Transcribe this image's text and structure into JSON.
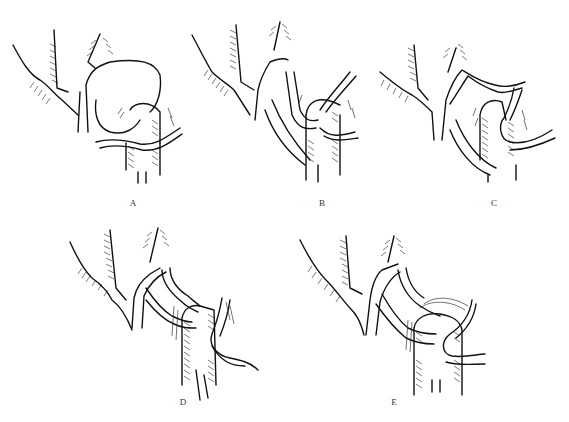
{
  "figure": {
    "panels": [
      {
        "id": "A",
        "label": "A",
        "x": 133,
        "y": 203
      },
      {
        "id": "B",
        "label": "B",
        "x": 322,
        "y": 203
      },
      {
        "id": "C",
        "label": "C",
        "x": 494,
        "y": 203
      },
      {
        "id": "D",
        "label": "D",
        "x": 183,
        "y": 402
      },
      {
        "id": "E",
        "label": "E",
        "x": 394,
        "y": 402
      }
    ],
    "ink_color": "#111111",
    "background": "#ffffff"
  }
}
